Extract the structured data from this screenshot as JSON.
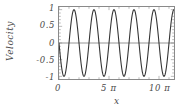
{
  "chart_data": {
    "type": "line",
    "title": "",
    "xlabel": "x",
    "ylabel": "Velocity",
    "xlim": [
      0,
      11.5
    ],
    "ylim": [
      -1.08,
      1.08
    ],
    "xlim_unit": "pi",
    "grid": false,
    "legend": null,
    "zero_line": 0,
    "xticks": [
      {
        "value": 0,
        "label": "0"
      },
      {
        "value": 5,
        "label": "5 π"
      },
      {
        "value": 10,
        "label": "10 π"
      }
    ],
    "yticks": [
      {
        "value": 1,
        "label": "1"
      },
      {
        "value": 0.5,
        "label": "0.5"
      },
      {
        "value": 0,
        "label": "0"
      },
      {
        "value": -0.5,
        "label": "-0.5"
      },
      {
        "value": -1,
        "label": "-1"
      }
    ],
    "x_minor_tick_step": 1,
    "y_minor_tick_step": 0.1,
    "series": [
      {
        "name": "velocity",
        "color": "#333333",
        "formula": "-sin(x)",
        "amplitude": 1,
        "period_in_pi": 2,
        "phase": 0,
        "samples": 480
      }
    ]
  },
  "axes": {
    "frame_color": "#8a8a8a",
    "tick_color": "#9a9a9a",
    "zero_line_color": "#7a7a7a",
    "label_color": "#4a4a4a"
  }
}
